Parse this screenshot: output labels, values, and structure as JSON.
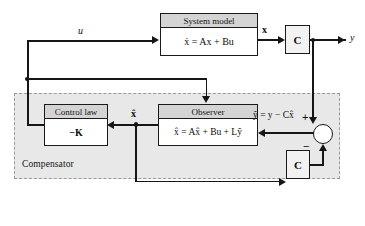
{
  "diagram": {
    "colors": {
      "line": "#161616",
      "block_fill": "#ffffff",
      "header_fill": "#d4d4d4",
      "region_fill": "#e8e8e8",
      "region_border": "#9a9a9a",
      "c_block_fill": "#f2f2f2"
    }
  },
  "blocks": {
    "system_model": {
      "header": "System model",
      "equation": "ẋ = Ax + Bu"
    },
    "observer": {
      "header": "Observer",
      "equation": "x̂ = Ax̂ + Bu + Lỹ"
    },
    "control_law": {
      "header": "Control law",
      "equation": "−K"
    },
    "c_top": {
      "label": "C"
    },
    "c_bottom": {
      "label": "C"
    }
  },
  "region": {
    "label": "Compensator"
  },
  "signals": {
    "u": "u",
    "x": "x",
    "y": "y",
    "x_hat": "x̂",
    "y_tilde_equation": "ỹ = y − Cx̂"
  },
  "summing_junction": {
    "plus": "+",
    "minus": "−"
  }
}
